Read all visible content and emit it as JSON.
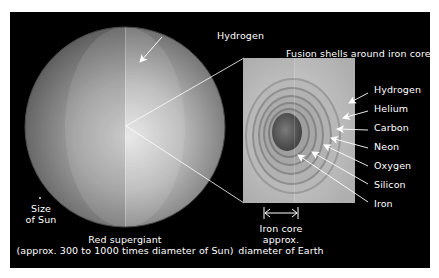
{
  "diagram": {
    "inset_title": "Fusion shells around iron core",
    "outer_label": "Hydrogen",
    "shell_labels": [
      {
        "name": "Hydrogen"
      },
      {
        "name": "Helium"
      },
      {
        "name": "Carbon"
      },
      {
        "name": "Neon"
      },
      {
        "name": "Oxygen"
      },
      {
        "name": "Silicon"
      },
      {
        "name": "Iron"
      }
    ],
    "sun_label_line1": "Size",
    "sun_label_line2": "of Sun",
    "star_label_line1": "Red supergiant",
    "star_label_line2": "(approx. 300 to 1000 times diameter of Sun)",
    "core_label_line1": "Iron core",
    "core_label_line2": "approx.",
    "core_label_line3": "diameter of Earth",
    "colors": {
      "background": "#000000",
      "page": "#ffffff",
      "text": "#ffffff",
      "sphere_outer": "#6a6a6a",
      "sphere_inner": "#d8d8d8",
      "inset_bg": "#b4b4b4",
      "core": "#5a5a5a"
    }
  }
}
